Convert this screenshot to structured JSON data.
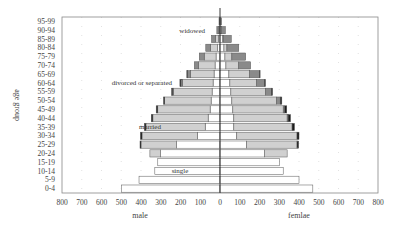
{
  "chart_data": {
    "type": "bar",
    "subtype": "population-pyramid-stacked",
    "title": "",
    "ylabel": "age group",
    "xlabel_left": "male",
    "xlabel_right": "femlae",
    "xlim": [
      -800,
      800
    ],
    "xticks": [
      "800",
      "700",
      "600",
      "500",
      "400",
      "300",
      "200",
      "100",
      "0",
      "100",
      "200",
      "300",
      "400",
      "500",
      "600",
      "700",
      "800"
    ],
    "grid": "dotted",
    "categories": [
      "0-4",
      "5-9",
      "10-14",
      "15-19",
      "20-24",
      "25-29",
      "30-34",
      "35-39",
      "40-44",
      "45-49",
      "50-54",
      "55-59",
      "60-64",
      "65-69",
      "70-74",
      "75-79",
      "80-84",
      "85-89",
      "90-94",
      "95-99"
    ],
    "segment_order": [
      "single",
      "married",
      "widowed",
      "divorced or separated"
    ],
    "colors": {
      "single": "#ffffff",
      "married": "#d0d0d0",
      "widowed": "#8a8a8a",
      "divorced or separated": "#1a1a1a",
      "outline": "#555555",
      "center_line": "#222222",
      "frame": "#888888"
    },
    "series": {
      "male": {
        "single": [
          500,
          410,
          330,
          315,
          300,
          220,
          115,
          75,
          60,
          50,
          45,
          40,
          35,
          30,
          25,
          20,
          12,
          8,
          3,
          1
        ],
        "married": [
          0,
          0,
          0,
          0,
          55,
          180,
          280,
          300,
          280,
          265,
          235,
          195,
          155,
          120,
          85,
          60,
          35,
          15,
          3,
          1
        ],
        "widowed": [
          0,
          0,
          0,
          0,
          0,
          0,
          0,
          0,
          0,
          0,
          0,
          5,
          8,
          15,
          20,
          25,
          25,
          20,
          10,
          3
        ],
        "divorced or separated": [
          0,
          0,
          0,
          0,
          0,
          5,
          8,
          8,
          8,
          8,
          6,
          5,
          5,
          3,
          0,
          0,
          0,
          0,
          0,
          0
        ]
      },
      "female": {
        "single": [
          470,
          400,
          320,
          300,
          225,
          135,
          85,
          70,
          70,
          65,
          60,
          55,
          50,
          45,
          30,
          25,
          20,
          12,
          5,
          2
        ],
        "married": [
          0,
          0,
          0,
          0,
          115,
          255,
          305,
          295,
          270,
          255,
          225,
          175,
          135,
          105,
          65,
          35,
          15,
          5,
          2,
          0
        ],
        "widowed": [
          0,
          0,
          0,
          0,
          0,
          0,
          0,
          0,
          5,
          8,
          20,
          30,
          40,
          50,
          60,
          70,
          60,
          40,
          20,
          6
        ],
        "divorced or separated": [
          0,
          0,
          0,
          0,
          0,
          8,
          10,
          12,
          12,
          10,
          8,
          6,
          5,
          3,
          0,
          0,
          0,
          0,
          0,
          0
        ]
      }
    },
    "annotations": [
      {
        "text": "widowed",
        "age_group": "90-94",
        "side": "male"
      },
      {
        "text": "divorced or separated",
        "age_group": "60-64",
        "side": "male"
      },
      {
        "text": "married",
        "age_group": "35-39",
        "side": "male"
      },
      {
        "text": "single",
        "age_group": "10-14",
        "side": "male"
      }
    ],
    "legend": "none (inline annotations)"
  }
}
